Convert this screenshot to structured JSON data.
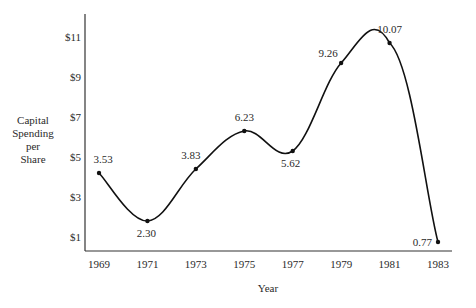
{
  "chart_data": {
    "type": "line",
    "title": "",
    "xlabel": "Year",
    "ylabel": [
      "Capital",
      "Spending",
      "per",
      "Share"
    ],
    "x": [
      1969,
      1971,
      1973,
      1975,
      1977,
      1979,
      1981,
      1983
    ],
    "series": [
      {
        "name": "Capital Spending per Share",
        "data_labels": [
          "3.53",
          "2.30",
          "3.83",
          "6.23",
          "5.62",
          "9.26",
          "10.07",
          "0.77"
        ],
        "labeled_values": [
          3.53,
          2.3,
          3.83,
          6.23,
          5.62,
          9.26,
          10.07,
          0.77
        ],
        "plotted_values": [
          4.2,
          1.8,
          4.4,
          6.3,
          5.3,
          9.7,
          10.7,
          0.75
        ]
      }
    ],
    "xticks": [
      "1969",
      "1971",
      "1973",
      "1975",
      "1977",
      "1979",
      "1981",
      "1983"
    ],
    "yticks": [
      {
        "value": 1,
        "label": "$1"
      },
      {
        "value": 3,
        "label": "$3"
      },
      {
        "value": 5,
        "label": "$5"
      },
      {
        "value": 7,
        "label": "$7"
      },
      {
        "value": 9,
        "label": "$9"
      },
      {
        "value": 11,
        "label": "$11"
      }
    ],
    "xlim": [
      1968.4,
      1983.6
    ],
    "ylim": [
      0.3,
      12.2
    ],
    "grid": false,
    "legend": "none",
    "line_style": "smooth"
  }
}
